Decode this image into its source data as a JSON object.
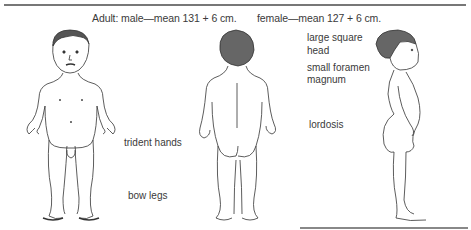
{
  "caption": {
    "male": "Adult: male—mean 131 + 6 cm.",
    "female": "female—mean 127 + 6 cm."
  },
  "labels": {
    "large_square": "large square",
    "head": "head",
    "small_foramen": "small foramen",
    "magnum": "magnum",
    "lordosis": "lordosis",
    "trident_hands": "trident hands",
    "bow_legs": "bow legs"
  },
  "figures": [
    {
      "view": "front",
      "icon": "child-figure-front"
    },
    {
      "view": "back",
      "icon": "child-figure-back"
    },
    {
      "view": "side",
      "icon": "child-figure-side"
    }
  ]
}
